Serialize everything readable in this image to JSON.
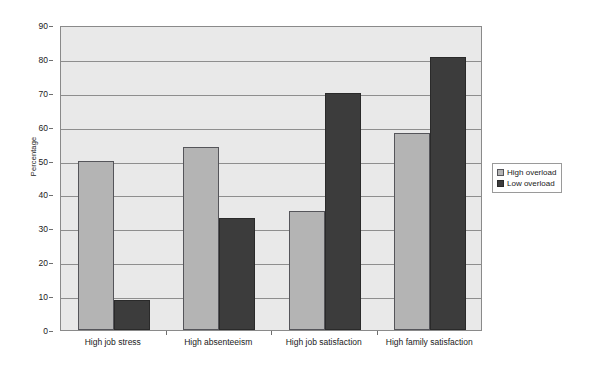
{
  "chart_data": {
    "type": "bar",
    "title": "",
    "subtitle": "",
    "xlabel": "",
    "ylabel": "Percentage",
    "categories": [
      "High job stress",
      "High absenteeism",
      "High job satisfaction",
      "High family satisfaction"
    ],
    "series": [
      {
        "name": "High overload",
        "values": [
          50,
          54,
          35,
          58
        ],
        "color": "#b4b4b4"
      },
      {
        "name": "Low overload",
        "values": [
          9,
          33,
          70,
          80.5
        ],
        "color": "#3c3c3c"
      }
    ],
    "ylim": [
      0,
      90
    ],
    "ytick_step": 10,
    "yticks": [
      0,
      10,
      20,
      30,
      40,
      50,
      60,
      70,
      80,
      90
    ],
    "ytick_labels": [
      "0",
      "10",
      "20",
      "30",
      "40",
      "50",
      "60",
      "70",
      "80",
      "90"
    ],
    "grid": true,
    "grid_axis": "y",
    "legend_position": "right",
    "plot_background": "#e9e9e9",
    "figure_background": "#ffffff",
    "axis_color": "#8a8a8a",
    "gridline_color": "#8e8e8e"
  },
  "legend": {
    "entries": [
      {
        "label": "High overload",
        "swatch": "series-high"
      },
      {
        "label": "Low overload",
        "swatch": "series-low"
      }
    ]
  }
}
